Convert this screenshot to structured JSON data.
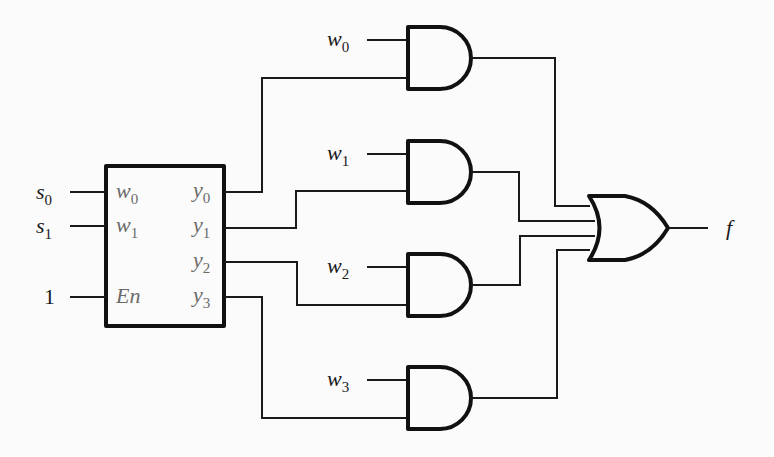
{
  "diagram": {
    "type": "logic-circuit",
    "decoder": {
      "inputs": [
        {
          "label": "s",
          "sub": "0",
          "pin": "w",
          "pin_sub": "0"
        },
        {
          "label": "s",
          "sub": "1",
          "pin": "w",
          "pin_sub": "1"
        },
        {
          "label": "1",
          "sub": "",
          "pin": "En",
          "pin_sub": ""
        }
      ],
      "outputs": [
        {
          "label": "y",
          "sub": "0"
        },
        {
          "label": "y",
          "sub": "1"
        },
        {
          "label": "y",
          "sub": "2"
        },
        {
          "label": "y",
          "sub": "3"
        }
      ]
    },
    "and_gates": [
      {
        "data_input": "w",
        "sub": "0",
        "select_from": "y0"
      },
      {
        "data_input": "w",
        "sub": "1",
        "select_from": "y1"
      },
      {
        "data_input": "w",
        "sub": "2",
        "select_from": "y2"
      },
      {
        "data_input": "w",
        "sub": "3",
        "select_from": "y3"
      }
    ],
    "or_gate": {
      "output": "f"
    }
  }
}
